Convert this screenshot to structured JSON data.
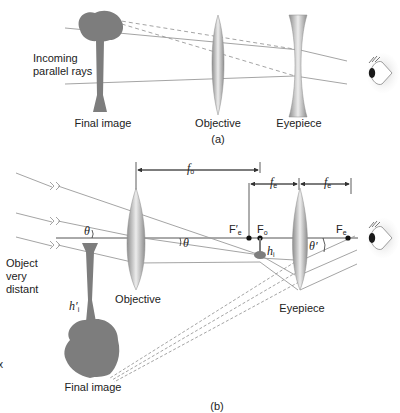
{
  "part_a": {
    "caption": "(a)",
    "labels": {
      "incoming_line1": "Incoming",
      "incoming_line2": "parallel rays",
      "final_image": "Final image",
      "objective": "Objective",
      "eyepiece": "Eyepiece"
    }
  },
  "part_b": {
    "caption": "(b)",
    "labels": {
      "object_line1": "Object",
      "object_line2": "very",
      "object_line3": "distant",
      "objective": "Objective",
      "eyepiece": "Eyepiece",
      "final_image": "Final image",
      "stray_mark": "x"
    },
    "symbols": {
      "f_o": "f",
      "f_o_sub": "o",
      "f_e_left": "f",
      "f_e_left_sub": "e",
      "f_e_right": "f",
      "f_e_right_sub": "e",
      "F_e_prime": "F′",
      "F_e_prime_sub": "e",
      "F_o": "F",
      "F_o_sub": "o",
      "F_e": "F",
      "F_e_sub": "e",
      "h_i": "h",
      "h_i_sub": "i",
      "h_i_prime": "h′",
      "h_i_prime_sub": "i",
      "theta_left": "θ",
      "theta_right": "θ",
      "theta_prime": "θ′"
    }
  },
  "colors": {
    "ray": "#9a9a9a",
    "lens_dark": "#8e8e8e",
    "lens_light": "#e9e9e9",
    "tree": "#7d7d7d",
    "axis": "#555555",
    "text": "#222222"
  }
}
